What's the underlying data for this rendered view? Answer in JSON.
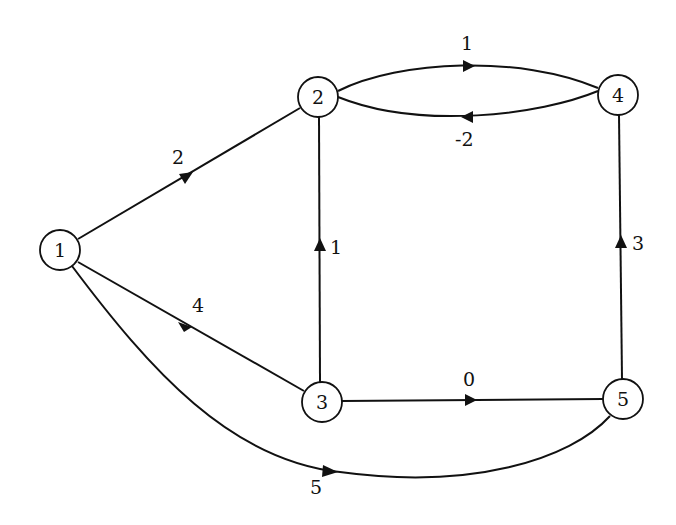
{
  "graph": {
    "type": "directed-weighted",
    "nodes": [
      {
        "id": "1",
        "label": "1",
        "x": 60,
        "y": 250
      },
      {
        "id": "2",
        "label": "2",
        "x": 318,
        "y": 97
      },
      {
        "id": "3",
        "label": "3",
        "x": 322,
        "y": 402
      },
      {
        "id": "4",
        "label": "4",
        "x": 618,
        "y": 95
      },
      {
        "id": "5",
        "label": "5",
        "x": 623,
        "y": 399
      }
    ],
    "edges": [
      {
        "from": "1",
        "to": "2",
        "weight": "2"
      },
      {
        "from": "1",
        "to": "3",
        "weight": "4"
      },
      {
        "from": "1",
        "to": "5",
        "weight": "5"
      },
      {
        "from": "2",
        "to": "4",
        "weight": "1"
      },
      {
        "from": "4",
        "to": "2",
        "weight": "-2"
      },
      {
        "from": "3",
        "to": "2",
        "weight": "1"
      },
      {
        "from": "3",
        "to": "5",
        "weight": "0"
      },
      {
        "from": "5",
        "to": "4",
        "weight": "3"
      }
    ]
  }
}
